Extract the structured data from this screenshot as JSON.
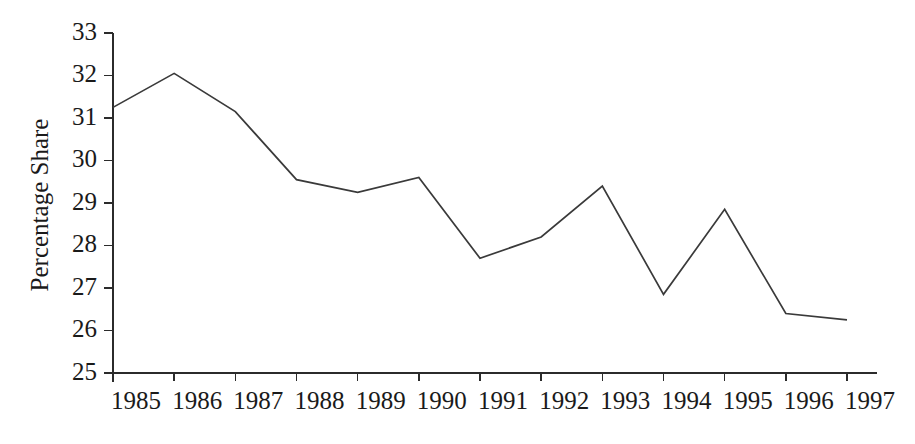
{
  "chart_data": {
    "type": "line",
    "title": "",
    "xlabel": "",
    "ylabel": "Percentage Share",
    "categories": [
      "1985",
      "1986",
      "1987",
      "1988",
      "1989",
      "1990",
      "1991",
      "1992",
      "1993",
      "1994",
      "1995",
      "1996",
      "1997"
    ],
    "x": [
      1985,
      1986,
      1987,
      1988,
      1989,
      1990,
      1991,
      1992,
      1993,
      1994,
      1995,
      1996,
      1997
    ],
    "values": [
      31.25,
      32.05,
      31.15,
      29.55,
      29.25,
      29.6,
      27.7,
      28.2,
      29.4,
      26.85,
      28.85,
      26.4,
      26.25
    ],
    "ylim": [
      25,
      33
    ],
    "xlim": [
      1985,
      1997
    ],
    "yticks": [
      25,
      26,
      27,
      28,
      29,
      30,
      31,
      32,
      33
    ],
    "ytick_labels": [
      "25",
      "26",
      "27",
      "28",
      "29",
      "30",
      "31",
      "32",
      "33"
    ],
    "xtick_labels": [
      "1985",
      "1986",
      "1987",
      "1988",
      "1989",
      "1990",
      "1991",
      "1992",
      "1993",
      "1994",
      "1995",
      "1996",
      "1997"
    ],
    "grid": false,
    "legend": false,
    "legend_position": "none",
    "line_color": "#3a3a3a",
    "axis_color": "#2b2b2b",
    "background_color": "#ffffff",
    "series": [
      {
        "name": "Percentage Share",
        "values": [
          31.25,
          32.05,
          31.15,
          29.55,
          29.25,
          29.6,
          27.7,
          28.2,
          29.4,
          26.85,
          28.85,
          26.4,
          26.25
        ]
      }
    ]
  },
  "figure": {
    "axis_label_y": "Percentage Share"
  }
}
